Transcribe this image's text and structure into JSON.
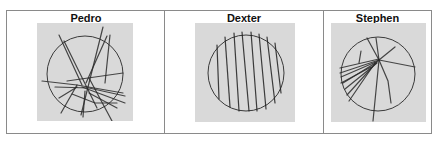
{
  "figure": {
    "panels": [
      {
        "title": "Pedro",
        "circle": {
          "cx": 48,
          "cy": 51,
          "r": 38
        },
        "strokes": [
          "M22,12 L45,62",
          "M27,18 L60,85",
          "M66,4 L44,92",
          "M70,13 L49,60",
          "M73,12 L68,60",
          "M5,58 L40,62 L86,70",
          "M30,58 L86,50",
          "M18,64 L52,65 L88,73",
          "M45,64 L88,80",
          "M52,70 L80,85",
          "M40,62 L24,90",
          "M48,68 L46,94",
          "M52,55 L75,98",
          "M35,71 L58,80 L80,80",
          "M22,75 L40,64"
        ],
        "color": "#2a2a2a"
      },
      {
        "title": "Dexter",
        "circle": {
          "cx": 51,
          "cy": 50,
          "r": 38
        },
        "strokes": [
          "M22,22 L24,76",
          "M30,14 L35,84",
          "M39,10 L44,88",
          "M47,9 L54,88",
          "M56,9 L62,88",
          "M64,11 L71,86",
          "M72,14 L80,80",
          "M80,20 L86,70"
        ],
        "color": "#1e1e1e"
      },
      {
        "title": "Stephen",
        "circle": {
          "cx": 47,
          "cy": 51,
          "r": 37
        },
        "strokes": [
          "M9,45 L48,36",
          "M9,50 L48,37",
          "M10,54 L47,38",
          "M12,60 L46,39",
          "M14,66 L46,40",
          "M16,72 L45,40",
          "M18,78 L44,40",
          "M10,60 L40,44",
          "M36,15 L48,37",
          "M45,15 L48,37",
          "M64,24 L48,37",
          "M48,37 L84,44",
          "M48,37 L42,98",
          "M48,37 L57,58 L60,80",
          "M30,28 L28,40"
        ],
        "color": "#2a2a2a"
      }
    ]
  }
}
